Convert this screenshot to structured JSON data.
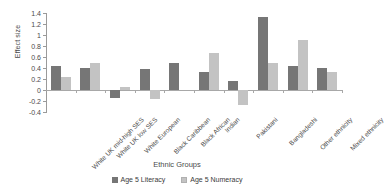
{
  "chart_data": {
    "type": "bar",
    "title": "",
    "xlabel": "Ethnic Groups",
    "ylabel": "Effect size",
    "ylim": [
      -0.4,
      1.4
    ],
    "ytick_step": 0.2,
    "yticks": [
      "1.4",
      "1.2",
      "1",
      "0.8",
      "0.6",
      "0.4",
      "0.2",
      "0",
      "-0.2",
      "-0.4"
    ],
    "grid": false,
    "legend_position": "bottom",
    "categories": [
      "White UK mid-high SES",
      "White UK low SES",
      "White European",
      "Black Caribbean",
      "Black African",
      "Indian",
      "Pakistani",
      "Bangladeshi",
      "Other ethnicity",
      "Mixed ethnicity"
    ],
    "series": [
      {
        "name": "Age 5 Literacy",
        "color": "#767676",
        "values": [
          0.43,
          0.4,
          -0.15,
          0.39,
          0.5,
          0.33,
          0.17,
          1.33,
          0.43,
          0.4
        ]
      },
      {
        "name": "Age 5 Numeracy",
        "color": "#c3c3c3",
        "values": [
          0.24,
          0.5,
          0.05,
          -0.17,
          0.0,
          0.68,
          -0.27,
          0.49,
          0.91,
          0.32
        ]
      }
    ]
  },
  "legend": {
    "items": [
      {
        "label": "Age 5 Literacy"
      },
      {
        "label": "Age 5 Numeracy"
      }
    ]
  }
}
